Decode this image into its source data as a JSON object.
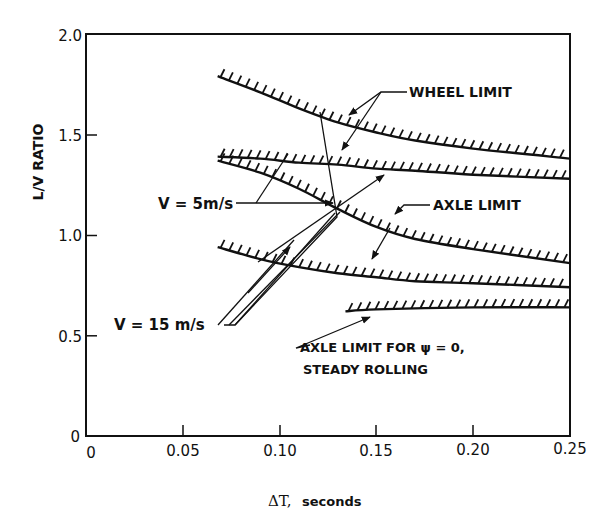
{
  "chart_data": {
    "type": "line",
    "title": "",
    "xlabel": "ΔT, seconds",
    "ylabel": "L/V RATIO",
    "xlim": [
      0,
      0.25
    ],
    "ylim": [
      0,
      2.0
    ],
    "x_ticks": [
      "0",
      "0.05",
      "0.10",
      "0.15",
      "0.20",
      "0.25"
    ],
    "y_ticks": [
      "0",
      "0.5",
      "1.0",
      "1.5",
      "2.0"
    ],
    "grid": false,
    "legend": "none (inline annotations)",
    "series": [
      {
        "name": "Wheel limit, V = 5 m/s",
        "group": "wheel",
        "x": [
          0.068,
          0.09,
          0.11,
          0.13,
          0.15,
          0.17,
          0.2,
          0.25
        ],
        "y": [
          1.79,
          1.71,
          1.63,
          1.56,
          1.51,
          1.47,
          1.43,
          1.38
        ]
      },
      {
        "name": "Wheel limit, V = 15 m/s",
        "group": "wheel",
        "x": [
          0.068,
          0.09,
          0.11,
          0.13,
          0.15,
          0.17,
          0.2,
          0.25
        ],
        "y": [
          1.39,
          1.38,
          1.36,
          1.35,
          1.33,
          1.32,
          1.3,
          1.28
        ]
      },
      {
        "name": "Axle limit, V = 5 m/s",
        "group": "axle",
        "x": [
          0.068,
          0.09,
          0.11,
          0.13,
          0.15,
          0.17,
          0.2,
          0.25
        ],
        "y": [
          1.37,
          1.31,
          1.23,
          1.13,
          1.04,
          0.98,
          0.93,
          0.86
        ]
      },
      {
        "name": "Axle limit, V = 15 m/s",
        "group": "axle",
        "x": [
          0.068,
          0.09,
          0.11,
          0.13,
          0.15,
          0.17,
          0.2,
          0.25
        ],
        "y": [
          0.94,
          0.88,
          0.84,
          0.81,
          0.79,
          0.77,
          0.76,
          0.74
        ]
      },
      {
        "name": "Axle limit for ψ = 0, steady rolling",
        "group": "steady",
        "x": [
          0.134,
          0.15,
          0.2,
          0.25
        ],
        "y": [
          0.62,
          0.63,
          0.64,
          0.64
        ]
      }
    ],
    "annotations": [
      "WHEEL LIMIT",
      "AXLE LIMIT",
      "V = 5m/s",
      "V = 15 m/s",
      "AXLE LIMIT FOR ψ = 0,",
      "STEADY ROLLING"
    ]
  },
  "labels": {
    "wheel_limit": "WHEEL LIMIT",
    "axle_limit": "AXLE LIMIT",
    "v5": "V = 5m/s",
    "v15": "V = 15 m/s",
    "steady_line1": "AXLE LIMIT FOR ψ = 0,",
    "steady_line2": "STEADY ROLLING",
    "xlabel_symbol": "ΔT,",
    "xlabel_unit": "seconds",
    "ylabel": "L/V RATIO"
  },
  "ticks": {
    "x": [
      "0",
      "0.05",
      "0.10",
      "0.15",
      "0.20",
      "0.25"
    ],
    "y": [
      "0",
      "0.5",
      "1.0",
      "1.5",
      "2.0"
    ]
  },
  "colors": {
    "ink": "#111111",
    "background": "#ffffff"
  }
}
